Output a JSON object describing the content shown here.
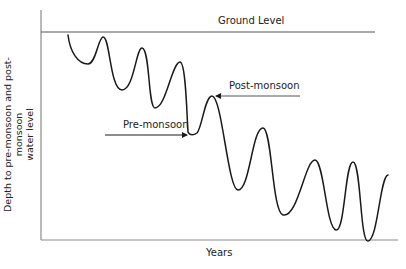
{
  "diagram": {
    "title": "",
    "ground_label": "Ground Level",
    "x_axis_label": "Years",
    "y_axis_label_line1": "Depth to pre-monsoon and post-monsoon",
    "y_axis_label_line2": "water level",
    "annotations": {
      "pre_monsoon": "Pre-monsoon",
      "post_monsoon": "Post-monsoon"
    },
    "colors": {
      "axis": "#8a8a8a",
      "curve": "#1a1a1a",
      "text": "#222222"
    }
  }
}
